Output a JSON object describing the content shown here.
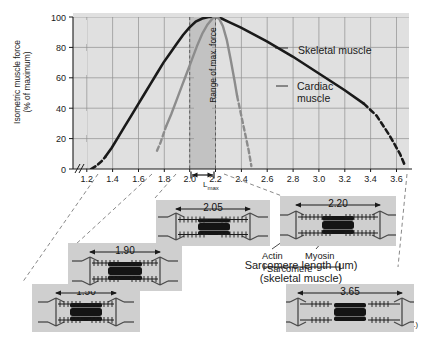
{
  "figure": {
    "credit": "(After Gordon et al.)"
  },
  "chart_data": {
    "type": "line",
    "title": "",
    "xlabel": "Sarcomere length (μm)",
    "xlabel_line2": "(skeletal muscle)",
    "ylabel": "Isometric muscle force",
    "ylabel_line2": "(% of maximum)",
    "xlim": [
      1.1,
      3.7
    ],
    "ylim": [
      0,
      100
    ],
    "xticks": [
      "1.2",
      "1.4",
      "1.6",
      "1.8",
      "2.0",
      "2.2",
      "2.4",
      "2.6",
      "2.8",
      "3.0",
      "3.2",
      "3.4",
      "3.6"
    ],
    "xtick_values": [
      1.2,
      1.4,
      1.6,
      1.8,
      2.0,
      2.2,
      2.4,
      2.6,
      2.8,
      3.0,
      3.2,
      3.4,
      3.6
    ],
    "yticks": [
      "0",
      "20",
      "40",
      "60",
      "80",
      "100"
    ],
    "ytick_values": [
      0,
      20,
      40,
      60,
      80,
      100
    ],
    "grid": true,
    "axis_break_x": true,
    "shaded_band": {
      "label": "Range of max. force",
      "x_start": 2.0,
      "x_end": 2.2,
      "color": "#bdbdbd"
    },
    "series": [
      {
        "name": "Skeletal muscle",
        "color": "#1a1a1a",
        "solid_points": [
          [
            1.35,
            8
          ],
          [
            1.4,
            14
          ],
          [
            1.45,
            21
          ],
          [
            1.5,
            28
          ],
          [
            1.55,
            35
          ],
          [
            1.6,
            42
          ],
          [
            1.65,
            49
          ],
          [
            1.7,
            56
          ],
          [
            1.75,
            63
          ],
          [
            1.8,
            70
          ],
          [
            1.85,
            76
          ],
          [
            1.9,
            82
          ],
          [
            1.95,
            88
          ],
          [
            2.0,
            93
          ],
          [
            2.05,
            97
          ],
          [
            2.1,
            99
          ],
          [
            2.15,
            100
          ],
          [
            2.2,
            100
          ],
          [
            2.25,
            99
          ],
          [
            2.3,
            97
          ],
          [
            2.4,
            93
          ],
          [
            2.6,
            84
          ],
          [
            2.8,
            74
          ],
          [
            3.0,
            63
          ],
          [
            3.2,
            52
          ],
          [
            3.35,
            43
          ]
        ],
        "dashed_start_points": [
          [
            1.24,
            0
          ],
          [
            1.28,
            2
          ],
          [
            1.32,
            5
          ],
          [
            1.35,
            8
          ]
        ],
        "dashed_end_points": [
          [
            3.35,
            43
          ],
          [
            3.45,
            35
          ],
          [
            3.55,
            22
          ],
          [
            3.63,
            10
          ],
          [
            3.67,
            2
          ]
        ]
      },
      {
        "name": "Cardiac muscle",
        "color": "#8c8c8c",
        "solid_points": [
          [
            1.82,
            28
          ],
          [
            1.86,
            36
          ],
          [
            1.9,
            45
          ],
          [
            1.94,
            54
          ],
          [
            1.98,
            63
          ],
          [
            2.02,
            72
          ],
          [
            2.06,
            81
          ],
          [
            2.1,
            89
          ],
          [
            2.14,
            95
          ],
          [
            2.18,
            99
          ],
          [
            2.2,
            100
          ],
          [
            2.23,
            99
          ],
          [
            2.26,
            94
          ],
          [
            2.29,
            85
          ],
          [
            2.32,
            72
          ],
          [
            2.35,
            58
          ],
          [
            2.37,
            48
          ]
        ],
        "dashed_start_points": [
          [
            1.75,
            12
          ],
          [
            1.78,
            18
          ],
          [
            1.82,
            28
          ]
        ],
        "dashed_end_points": [
          [
            2.37,
            48
          ],
          [
            2.4,
            36
          ],
          [
            2.43,
            24
          ],
          [
            2.46,
            12
          ],
          [
            2.48,
            2
          ]
        ]
      }
    ],
    "annotations": [
      {
        "text": "Skeletal muscle",
        "x": 2.75,
        "y": 82
      },
      {
        "text": "Cardiac muscle",
        "x": 2.72,
        "y": 58
      },
      {
        "text": "L",
        "sub": "max",
        "x": 2.1,
        "y": -14
      }
    ]
  },
  "sarcomere_panels": [
    {
      "id": "panel-1-50",
      "value": "1.50",
      "overlap": "maximal",
      "state": "over-shortened"
    },
    {
      "id": "panel-1-90",
      "value": "1.90",
      "overlap": "high",
      "state": "shortened"
    },
    {
      "id": "panel-2-05",
      "value": "2.05",
      "overlap": "optimal",
      "state": "optimal"
    },
    {
      "id": "panel-2-20",
      "value": "2.20",
      "overlap": "optimal",
      "state": "optimal"
    },
    {
      "id": "panel-3-65",
      "value": "3.65",
      "overlap": "none",
      "state": "over-stretched"
    }
  ],
  "filament_labels": {
    "actin": "Actin",
    "myosin": "Myosin",
    "sarcomere": "Sarcomere"
  }
}
